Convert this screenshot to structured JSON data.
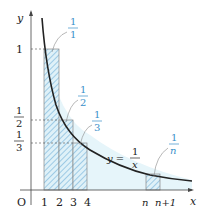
{
  "diagram": {
    "axes": {
      "x_label": "x",
      "y_label": "y",
      "origin_label": "O"
    },
    "x_ticks": [
      "1",
      "2",
      "3",
      "4",
      "n",
      "n+1"
    ],
    "y_ticks": [
      {
        "num": "1",
        "den": "",
        "single": "1"
      },
      {
        "num": "1",
        "den": "2"
      },
      {
        "num": "1",
        "den": "3"
      }
    ],
    "rect_labels": [
      {
        "num": "1",
        "den": "1"
      },
      {
        "num": "1",
        "den": "2"
      },
      {
        "num": "1",
        "den": "3"
      },
      {
        "num": "1",
        "den": "n"
      }
    ],
    "curve_label": {
      "lhs": "y =",
      "num": "1",
      "den": "x"
    },
    "colors": {
      "fill": "#dff1f8",
      "hatch": "#3a8fc9",
      "curve": "#222222",
      "label": "#3a8fc9"
    }
  }
}
